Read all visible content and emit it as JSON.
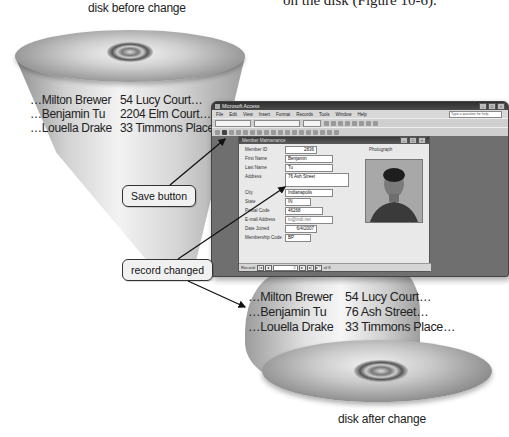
{
  "figure": {
    "top_caption": "disk before change",
    "bottom_caption": "disk after change",
    "body_text_fragment": "on the disk (Figure 10-6)."
  },
  "disk_before": {
    "names": [
      "…Milton Brewer",
      "…Benjamin Tu",
      "…Louella Drake"
    ],
    "addresses": [
      "54 Lucy Court…",
      "2204 Elm Court…",
      "33 Timmons Place…"
    ]
  },
  "disk_after": {
    "names": [
      "…Milton Brewer",
      "…Benjamin Tu",
      "…Louella Drake"
    ],
    "addresses": [
      "54 Lucy Court…",
      "76 Ash Street…",
      "33 Timmons Place…"
    ]
  },
  "callouts": {
    "save_button": "Save button",
    "record_changed": "record changed"
  },
  "access_window": {
    "title": "Microsoft Access",
    "menu": [
      "File",
      "Edit",
      "View",
      "Insert",
      "Format",
      "Records",
      "Tools",
      "Window",
      "Help"
    ],
    "help_placeholder": "Type a question for help",
    "form": {
      "title": "Member Maintenance",
      "photo_label": "Photograph",
      "fields": [
        {
          "label": "Member ID",
          "value": "2836"
        },
        {
          "label": "First Name",
          "value": "Benjamin"
        },
        {
          "label": "Last Name",
          "value": "Tu"
        },
        {
          "label": "Address",
          "value": "76 Ash Street"
        },
        {
          "label": "City",
          "value": "Indianapolis"
        },
        {
          "label": "State",
          "value": "IN"
        },
        {
          "label": "Postal Code",
          "value": "46268"
        },
        {
          "label": "E-mail Address",
          "value": "tu@indi.net"
        },
        {
          "label": "Date Joined",
          "value": "6/4/2007"
        },
        {
          "label": "Membership Code",
          "value": "BP"
        }
      ],
      "nav": {
        "label": "Record:",
        "current": "2",
        "total_text": "of 8"
      }
    }
  },
  "colors": {
    "disk_light": "#f2f2f2",
    "disk_dark": "#6e6e6e",
    "window_frame": "#6f6f6f",
    "callout_bg": "#f1f1f1"
  }
}
